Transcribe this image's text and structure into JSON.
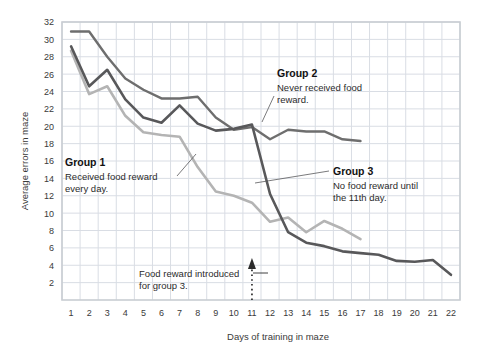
{
  "chart_data": {
    "type": "line",
    "title": "",
    "xlabel": "Days of training in maze",
    "ylabel": "Average errors in maze",
    "xlim": [
      1,
      22
    ],
    "ylim": [
      0,
      32
    ],
    "ytick_step": 2,
    "grid": true,
    "legend_position": "inline-annotations",
    "x": [
      1,
      2,
      3,
      4,
      5,
      6,
      7,
      8,
      9,
      10,
      11,
      12,
      13,
      14,
      15,
      16,
      17,
      18,
      19,
      20,
      21,
      22
    ],
    "xticks": [
      "1",
      "2",
      "3",
      "4",
      "5",
      "6",
      "7",
      "8",
      "9",
      "10",
      "11",
      "12",
      "13",
      "14",
      "15",
      "16",
      "17",
      "18",
      "19",
      "20",
      "21",
      "22"
    ],
    "yticks": [
      "2",
      "4",
      "6",
      "8",
      "10",
      "12",
      "14",
      "16",
      "18",
      "20",
      "22",
      "24",
      "26",
      "28",
      "30",
      "32"
    ],
    "series": [
      {
        "name": "Group 2",
        "color": "#6e6e6e",
        "width": 2.4,
        "values": [
          30.9,
          30.9,
          28.0,
          25.5,
          24.2,
          23.2,
          23.2,
          23.4,
          21.0,
          19.6,
          19.9,
          18.5,
          19.6,
          19.4,
          19.4,
          18.5,
          18.3,
          null,
          null,
          null,
          null,
          null
        ]
      },
      {
        "name": "Group 3",
        "color": "#58585a",
        "width": 2.6,
        "values": [
          29.2,
          24.6,
          26.5,
          23.1,
          21.0,
          20.4,
          22.4,
          20.3,
          19.5,
          19.7,
          20.2,
          12.2,
          7.8,
          6.6,
          6.2,
          5.6,
          5.4,
          5.2,
          4.5,
          4.4,
          4.6,
          2.9
        ]
      },
      {
        "name": "Group 1",
        "color": "#b4b4b4",
        "width": 2.6,
        "values": [
          28.7,
          23.7,
          24.6,
          21.2,
          19.3,
          19.0,
          18.8,
          15.3,
          12.5,
          12.0,
          11.2,
          9.0,
          9.5,
          7.8,
          9.1,
          8.2,
          7.0,
          null,
          null,
          null,
          null,
          null
        ]
      }
    ],
    "annotations": [
      {
        "id": "group1",
        "title": "Group 1",
        "body_lines": [
          "Received food reward",
          "every day."
        ]
      },
      {
        "id": "group2",
        "title": "Group 2",
        "body_lines": [
          "Never received food",
          "reward."
        ]
      },
      {
        "id": "group3",
        "title": "Group 3",
        "body_lines": [
          "No food reward until",
          "the 11th day."
        ]
      },
      {
        "id": "food-reward-marker",
        "title": "",
        "body_lines": [
          "Food reward introduced",
          "for group 3."
        ],
        "marker_day": 11
      }
    ],
    "colors": {
      "grid": "#d9dde4",
      "frame": "#c9cdd3",
      "text": "#231f20",
      "background": "#ffffff"
    }
  }
}
